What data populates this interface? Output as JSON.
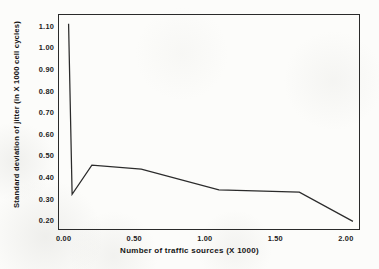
{
  "chart_data": {
    "type": "line",
    "title": "",
    "xlabel": "Number of traffic sources (X 1000)",
    "ylabel": "Standard deviation of jitter (in X 1000 cell cycles)",
    "xlim": [
      -0.04,
      2.1
    ],
    "ylim": [
      0.155,
      1.155
    ],
    "xticks": [
      "0.00",
      "0.50",
      "1.00",
      "1.50",
      "2.00"
    ],
    "xtick_values": [
      0.0,
      0.5,
      1.0,
      1.5,
      2.0
    ],
    "yticks": [
      "0.20",
      "0.30",
      "0.40",
      "0.50",
      "0.60",
      "0.70",
      "0.80",
      "0.90",
      "1.00",
      "1.10"
    ],
    "ytick_values": [
      0.2,
      0.3,
      0.4,
      0.5,
      0.6,
      0.7,
      0.8,
      0.9,
      1.0,
      1.1
    ],
    "grid": false,
    "legend": false,
    "legend_position": "none",
    "line_color": "#2b2b2b",
    "line_width": 1.25,
    "series": [
      {
        "name": "Standard deviation of jitter",
        "x": [
          0.035,
          0.06,
          0.2,
          0.55,
          1.1,
          1.67,
          2.05
        ],
        "y": [
          1.11,
          0.32,
          0.455,
          0.437,
          0.341,
          0.33,
          0.195
        ]
      }
    ]
  },
  "axes": {
    "frame_color": "#2a2a2a"
  }
}
